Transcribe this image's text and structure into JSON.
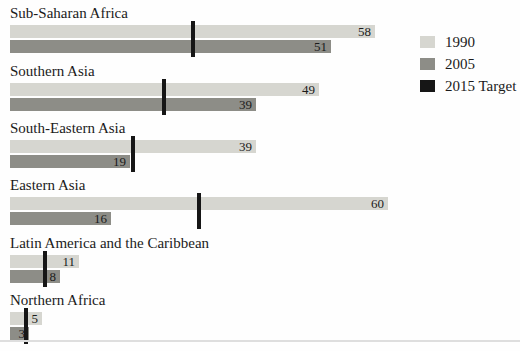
{
  "chart_data": {
    "type": "bar",
    "orientation": "horizontal",
    "categories": [
      "Sub-Saharan Africa",
      "Southern Asia",
      "South-Eastern Asia",
      "Eastern Asia",
      "Latin America and the Caribbean",
      "Northern Africa"
    ],
    "series": [
      {
        "name": "1990",
        "values": [
          58,
          49,
          39,
          60,
          11,
          5
        ]
      },
      {
        "name": "2005",
        "values": [
          51,
          39,
          19,
          16,
          8,
          3
        ]
      },
      {
        "name": "2015 Target",
        "values": [
          29,
          24.5,
          19.5,
          30,
          5.5,
          2.5
        ]
      }
    ],
    "value_labels_shown_for": [
      "1990",
      "2005"
    ],
    "xlim": [
      0,
      64
    ],
    "grid": false,
    "legend_position": "top-right",
    "title": "",
    "xlabel": "",
    "ylabel": ""
  },
  "legend": {
    "items": [
      {
        "label": "1990",
        "color": "#d6d6d0"
      },
      {
        "label": "2005",
        "color": "#8d8d87"
      },
      {
        "label": "2015 Target",
        "color": "#161616"
      }
    ]
  },
  "colors": {
    "bar_1990": "#d6d6d0",
    "bar_2005": "#8d8d87",
    "target_marker": "#161616",
    "text": "#1b1b1b",
    "bottom_rule": "#dedede",
    "background": "#fefefe"
  },
  "layout": {
    "bar_start_x": 10,
    "px_per_unit": 6.3,
    "section_tops": [
      5,
      63,
      120,
      177,
      235,
      292
    ]
  }
}
